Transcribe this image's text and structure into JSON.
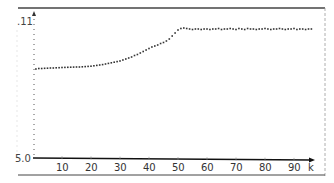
{
  "chart_data": {
    "type": "scatter",
    "title": "",
    "xlabel": "k",
    "ylabel": "",
    "y_tick_labels": [
      ".11",
      "5.0"
    ],
    "x_tick_labels": [
      "10",
      "20",
      "30",
      "40",
      "50",
      "60",
      "70",
      "80",
      "90"
    ],
    "xlim": [
      0,
      97
    ],
    "ylim_display": {
      "bottom_label": "5.0",
      "top_label": ".11"
    },
    "grid": false,
    "legend": null,
    "marker": "dot",
    "series": [
      {
        "name": "sequence",
        "x": [
          1,
          2,
          3,
          4,
          5,
          6,
          7,
          8,
          9,
          10,
          11,
          12,
          13,
          14,
          15,
          16,
          17,
          18,
          19,
          20,
          21,
          22,
          23,
          24,
          25,
          26,
          27,
          28,
          29,
          30,
          31,
          32,
          33,
          34,
          35,
          36,
          37,
          38,
          39,
          40,
          41,
          42,
          43,
          44,
          45,
          46,
          47,
          48,
          49,
          50,
          51,
          52,
          53,
          54,
          55,
          56,
          57,
          58,
          59,
          60,
          61,
          62,
          63,
          64,
          65,
          66,
          67,
          68,
          69,
          70,
          71,
          72,
          73,
          74,
          75,
          76,
          77,
          78,
          79,
          80,
          81,
          82,
          83,
          84,
          85,
          86,
          87,
          88,
          89,
          90,
          91,
          92,
          93,
          94,
          95,
          96
        ],
        "y_px": [
          69,
          68.5,
          68.5,
          68.3,
          68.2,
          68,
          68,
          67.8,
          67.7,
          67.5,
          67.4,
          67.3,
          67.2,
          67.1,
          67,
          67,
          66.8,
          66.6,
          66.4,
          66.2,
          65.8,
          65.4,
          65,
          64.6,
          64,
          63.4,
          62.8,
          62.2,
          61.6,
          61,
          60,
          59,
          58,
          57,
          55.5,
          54.5,
          53,
          51.5,
          50,
          48.5,
          47,
          46,
          45,
          43.5,
          42.5,
          41,
          39,
          36,
          33,
          30,
          28.5,
          28,
          28.5,
          29,
          29.5,
          29,
          29,
          29.5,
          29,
          29,
          29.5,
          29,
          29,
          28.5,
          29.5,
          29,
          29,
          28.5,
          29,
          29.5,
          28.5,
          29,
          29.5,
          28.5,
          29,
          29,
          29.5,
          29,
          29,
          28.5,
          29,
          29.5,
          29,
          29,
          28.5,
          29,
          29.5,
          29,
          29,
          28.5,
          29.5,
          29,
          29,
          29.5,
          29,
          29
        ]
      }
    ]
  },
  "axes": {
    "y_top_label": ".11",
    "y_bottom_label": "5.0",
    "x_axis_letter": "k",
    "x_ticks": [
      "10",
      "20",
      "30",
      "40",
      "50",
      "60",
      "70",
      "80",
      "90"
    ]
  }
}
